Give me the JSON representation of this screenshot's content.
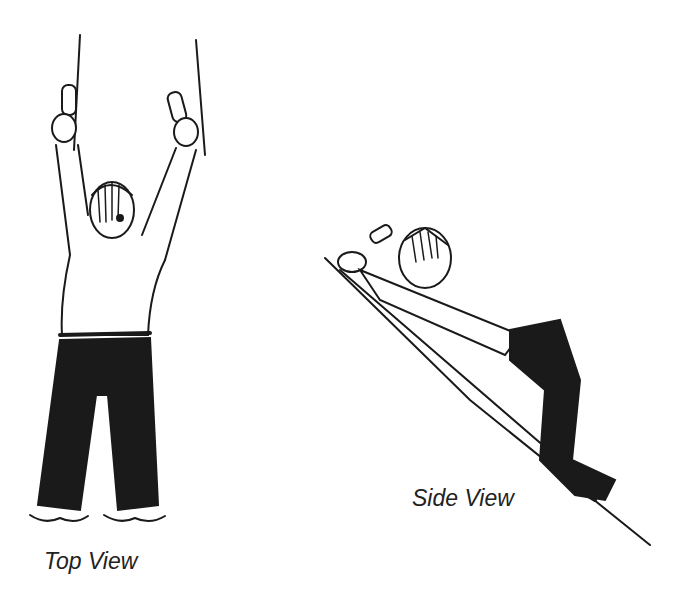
{
  "figure": {
    "panels": [
      {
        "id": "top",
        "caption": "Top View"
      },
      {
        "id": "side",
        "caption": "Side View"
      }
    ],
    "colors": {
      "ink": "#1a1a1a",
      "background": "#ffffff"
    }
  }
}
